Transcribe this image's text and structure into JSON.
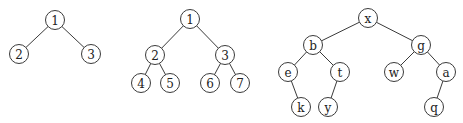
{
  "diagram": {
    "type": "binary-trees",
    "node_radius": 9.5,
    "colors": {
      "stroke": "#3a3a3a",
      "text": "#222222",
      "background": "#ffffff"
    },
    "trees": [
      {
        "name": "tree-1",
        "nodes": [
          {
            "id": "t1n1",
            "label": "1",
            "x": 55,
            "y": 20
          },
          {
            "id": "t1n2",
            "label": "2",
            "x": 19,
            "y": 54
          },
          {
            "id": "t1n3",
            "label": "3",
            "x": 91,
            "y": 54
          }
        ],
        "edges": [
          [
            "t1n1",
            "t1n2"
          ],
          [
            "t1n1",
            "t1n3"
          ]
        ]
      },
      {
        "name": "tree-2",
        "nodes": [
          {
            "id": "t2n1",
            "label": "1",
            "x": 190,
            "y": 19
          },
          {
            "id": "t2n2",
            "label": "2",
            "x": 155,
            "y": 55
          },
          {
            "id": "t2n3",
            "label": "3",
            "x": 225,
            "y": 55
          },
          {
            "id": "t2n4",
            "label": "4",
            "x": 141,
            "y": 83
          },
          {
            "id": "t2n5",
            "label": "5",
            "x": 170,
            "y": 83
          },
          {
            "id": "t2n6",
            "label": "6",
            "x": 210,
            "y": 83
          },
          {
            "id": "t2n7",
            "label": "7",
            "x": 240,
            "y": 83
          }
        ],
        "edges": [
          [
            "t2n1",
            "t2n2"
          ],
          [
            "t2n1",
            "t2n3"
          ],
          [
            "t2n2",
            "t2n4"
          ],
          [
            "t2n2",
            "t2n5"
          ],
          [
            "t2n3",
            "t2n6"
          ],
          [
            "t2n3",
            "t2n7"
          ]
        ]
      },
      {
        "name": "tree-3",
        "nodes": [
          {
            "id": "t3x",
            "label": "x",
            "x": 368,
            "y": 18
          },
          {
            "id": "t3b",
            "label": "b",
            "x": 313,
            "y": 45
          },
          {
            "id": "t3g",
            "label": "g",
            "x": 421,
            "y": 45
          },
          {
            "id": "t3e",
            "label": "e",
            "x": 288,
            "y": 72
          },
          {
            "id": "t3t",
            "label": "t",
            "x": 340,
            "y": 72
          },
          {
            "id": "t3w",
            "label": "w",
            "x": 394,
            "y": 72
          },
          {
            "id": "t3a",
            "label": "a",
            "x": 446,
            "y": 72
          },
          {
            "id": "t3k",
            "label": "k",
            "x": 301,
            "y": 107
          },
          {
            "id": "t3y",
            "label": "y",
            "x": 328,
            "y": 107
          },
          {
            "id": "t3q",
            "label": "q",
            "x": 434,
            "y": 107
          }
        ],
        "edges": [
          [
            "t3x",
            "t3b"
          ],
          [
            "t3x",
            "t3g"
          ],
          [
            "t3b",
            "t3e"
          ],
          [
            "t3b",
            "t3t"
          ],
          [
            "t3g",
            "t3w"
          ],
          [
            "t3g",
            "t3a"
          ],
          [
            "t3e",
            "t3k"
          ],
          [
            "t3t",
            "t3y"
          ],
          [
            "t3a",
            "t3q"
          ]
        ]
      }
    ]
  }
}
